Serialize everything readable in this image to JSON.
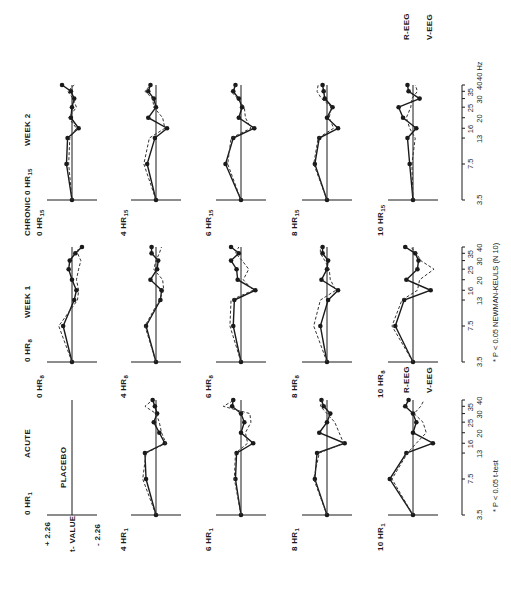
{
  "figure": {
    "columns": [
      {
        "key": "acute",
        "label": "ACUTE"
      },
      {
        "key": "week1",
        "label": "WEEK 1",
        "group_label": "CHRONIC"
      },
      {
        "key": "week2",
        "label": "WEEK 2"
      }
    ],
    "y_axis": {
      "label": "t- VALUE",
      "top": "+ 2.26",
      "bottom": "- 2.26"
    },
    "x_axis": {
      "ticks_lower": [
        "3.5",
        "13",
        "20",
        "30",
        "40"
      ],
      "ticks_upper": [
        "7.5",
        "16",
        "25",
        "35"
      ],
      "unit": "40 Hz"
    },
    "placebo_label": "PLACEBO",
    "legend": {
      "r_eeg": "R-EEG",
      "v_eeg": "V-EEG"
    },
    "footnotes": {
      "acute": "* P < 0.05 t-test",
      "chronic": "* P < 0.05 NEWMAN-KEULS (N 10)"
    }
  },
  "chart_data": {
    "type": "line",
    "title": "",
    "xlabel": "Frequency (Hz)",
    "ylabel": "t-value",
    "ylim": [
      -2.26,
      2.26
    ],
    "x": [
      3.5,
      7.5,
      13,
      16,
      20,
      25,
      30,
      35,
      40
    ],
    "panels": [
      {
        "column": "ACUTE",
        "row": "0 HR1",
        "note": "PLACEBO",
        "series": []
      },
      {
        "column": "ACUTE",
        "row": "4 HR1",
        "series": [
          {
            "name": "R-EEG",
            "values": [
              0.0,
              0.9,
              1.0,
              -0.8,
              -0.3,
              0.2,
              -0.1,
              0.1,
              0.3
            ]
          },
          {
            "name": "V-EEG",
            "values": [
              0.0,
              1.2,
              0.9,
              -0.9,
              -0.5,
              -0.3,
              0.0,
              1.0,
              0.3
            ]
          }
        ]
      },
      {
        "column": "ACUTE",
        "row": "6 HR1",
        "series": [
          {
            "name": "R-EEG",
            "values": [
              0.0,
              0.5,
              0.4,
              -1.1,
              0.0,
              -0.3,
              0.0,
              0.8,
              0.7
            ]
          },
          {
            "name": "V-EEG",
            "values": [
              0.0,
              0.6,
              0.5,
              -0.6,
              -0.4,
              -0.9,
              -0.8,
              1.6,
              0.6
            ]
          }
        ]
      },
      {
        "column": "ACUTE",
        "row": "8 HR1",
        "series": [
          {
            "name": "R-EEG",
            "values": [
              0.0,
              1.1,
              0.9,
              -1.6,
              0.7,
              0.0,
              -0.3,
              0.3,
              0.5
            ]
          },
          {
            "name": "V-EEG",
            "values": [
              0.0,
              1.2,
              0.7,
              -1.5,
              -1.1,
              -0.7,
              0.0,
              0.6,
              0.4
            ]
          }
        ]
      },
      {
        "column": "ACUTE",
        "row": "10 HR1",
        "series": [
          {
            "name": "R-EEG",
            "values": [
              0.0,
              2.1,
              0.6,
              -1.8,
              0.0,
              -0.3,
              0.0,
              0.7,
              0.4
            ]
          },
          {
            "name": "V-EEG",
            "values": [
              0.0,
              1.9,
              0.5,
              -0.3,
              -1.2,
              -0.9,
              -0.1,
              -0.7,
              -1.0
            ]
          }
        ]
      },
      {
        "column": "WEEK 1",
        "row": "0 HR8",
        "series": [
          {
            "name": "R-EEG",
            "values": [
              0.0,
              0.8,
              -0.2,
              -0.4,
              0.0,
              0.3,
              0.2,
              -0.3,
              -0.9
            ]
          },
          {
            "name": "V-EEG",
            "values": [
              0.0,
              1.2,
              -0.5,
              -0.6,
              -0.4,
              -0.6,
              -0.8,
              -0.5,
              -0.6
            ]
          }
        ]
      },
      {
        "column": "WEEK 1",
        "row": "4 HR8",
        "series": [
          {
            "name": "R-EEG",
            "values": [
              0.0,
              0.9,
              -0.4,
              -0.5,
              0.5,
              -0.1,
              -0.2,
              0.4,
              0.4
            ]
          },
          {
            "name": "V-EEG",
            "values": [
              0.0,
              1.0,
              -0.3,
              -0.7,
              -0.6,
              0.2,
              0.0,
              -0.3,
              -0.5
            ]
          }
        ]
      },
      {
        "column": "WEEK 1",
        "row": "6 HR8",
        "series": [
          {
            "name": "R-EEG",
            "values": [
              0.0,
              0.7,
              0.6,
              -1.3,
              0.3,
              0.4,
              0.9,
              0.2,
              0.9
            ]
          },
          {
            "name": "V-EEG",
            "values": [
              0.0,
              1.0,
              0.9,
              -1.1,
              -0.2,
              -0.7,
              -0.1,
              0.5,
              0.2
            ]
          }
        ]
      },
      {
        "column": "WEEK 1",
        "row": "8 HR8",
        "series": [
          {
            "name": "R-EEG",
            "values": [
              0.0,
              0.6,
              -0.1,
              -1.0,
              0.5,
              0.0,
              -0.1,
              0.4,
              0.4
            ]
          },
          {
            "name": "V-EEG",
            "values": [
              0.0,
              1.2,
              0.6,
              -0.8,
              -0.3,
              -0.2,
              0.2,
              0.6,
              0.6
            ]
          }
        ]
      },
      {
        "column": "WEEK 1",
        "row": "10 HR8",
        "series": [
          {
            "name": "R-EEG",
            "values": [
              0.0,
              1.6,
              0.8,
              -1.6,
              0.6,
              -0.4,
              -0.5,
              -0.2,
              0.7
            ]
          },
          {
            "name": "V-EEG",
            "values": [
              0.0,
              1.9,
              1.0,
              -0.4,
              -0.6,
              -1.9,
              -0.7,
              -0.3,
              0.2
            ]
          }
        ]
      },
      {
        "column": "WEEK 2",
        "row": "0 HR15",
        "series": [
          {
            "name": "R-EEG",
            "values": [
              0.0,
              0.5,
              0.4,
              -0.6,
              0.1,
              0.0,
              -0.2,
              0.1,
              0.9
            ]
          },
          {
            "name": "V-EEG",
            "values": [
              0.0,
              0.3,
              0.2,
              -0.4,
              0.3,
              -0.4,
              -0.1,
              0.4,
              -0.2
            ]
          }
        ]
      },
      {
        "column": "WEEK 2",
        "row": "4 HR15",
        "series": [
          {
            "name": "R-EEG",
            "values": [
              0.0,
              0.8,
              0.1,
              -1.0,
              0.7,
              0.0,
              0.2,
              0.7,
              0.5
            ]
          },
          {
            "name": "V-EEG",
            "values": [
              0.0,
              1.1,
              0.6,
              -0.8,
              -0.6,
              0.2,
              0.3,
              1.0,
              0.5
            ]
          }
        ]
      },
      {
        "column": "WEEK 2",
        "row": "6 HR15",
        "series": [
          {
            "name": "R-EEG",
            "values": [
              0.0,
              1.4,
              0.7,
              -1.2,
              0.2,
              -0.1,
              0.2,
              0.7,
              0.5
            ]
          },
          {
            "name": "V-EEG",
            "values": [
              0.0,
              1.2,
              0.9,
              -0.9,
              -0.4,
              -0.3,
              0.3,
              0.9,
              0.4
            ]
          }
        ]
      },
      {
        "column": "WEEK 2",
        "row": "8 HR15",
        "series": [
          {
            "name": "R-EEG",
            "values": [
              0.0,
              1.1,
              0.7,
              -1.0,
              0.0,
              -0.5,
              0.2,
              0.3,
              0.4
            ]
          },
          {
            "name": "V-EEG",
            "values": [
              0.0,
              1.2,
              0.8,
              -0.6,
              -0.2,
              -0.4,
              0.5,
              0.9,
              0.8
            ]
          }
        ]
      },
      {
        "column": "WEEK 2",
        "row": "10 HR15",
        "series": [
          {
            "name": "R-EEG",
            "values": [
              0.0,
              0.3,
              0.5,
              -0.3,
              0.9,
              1.3,
              -0.6,
              0.4,
              0.5
            ]
          },
          {
            "name": "V-EEG",
            "values": [
              0.0,
              0.1,
              -0.2,
              0.3,
              0.6,
              0.2,
              0.1,
              -0.4,
              -0.2
            ]
          }
        ]
      }
    ],
    "legend": [
      "R-EEG (solid, filled circles)",
      "V-EEG (dashed)"
    ],
    "grid": false,
    "orientation": "figure rotated 90 degrees counter-clockwise on page"
  }
}
